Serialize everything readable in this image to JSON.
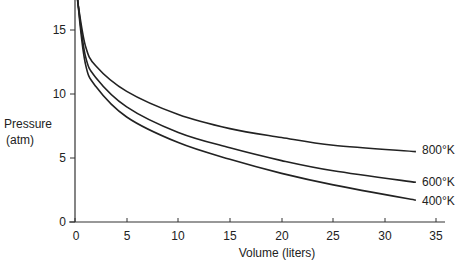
{
  "chart_data": {
    "type": "line",
    "title": "",
    "xlabel": "Volume (liters)",
    "ylabel": "Pressure (atm)",
    "ylabel_lines": [
      "Pressure",
      "(atm)"
    ],
    "xlim": [
      0,
      36
    ],
    "ylim": [
      0,
      17.3
    ],
    "xticks": [
      0,
      5,
      10,
      15,
      20,
      25,
      30,
      35
    ],
    "yticks": [
      0,
      5,
      10,
      15
    ],
    "grid": false,
    "legend": "inline labels at right end of curves",
    "x": [
      0.3,
      1,
      2,
      5,
      10,
      15,
      20,
      25,
      33
    ],
    "series": [
      {
        "name": "800°K",
        "values": [
          17.0,
          13.8,
          12.2,
          10.2,
          8.4,
          7.3,
          6.6,
          6.0,
          5.5
        ]
      },
      {
        "name": "600°K",
        "values": [
          17.0,
          13.0,
          11.3,
          9.0,
          7.0,
          5.8,
          4.8,
          4.0,
          3.1
        ]
      },
      {
        "name": "400°K",
        "values": [
          17.0,
          12.4,
          10.6,
          8.2,
          6.2,
          4.9,
          3.8,
          2.9,
          1.7
        ]
      }
    ]
  },
  "axes": {
    "x_ticks": [
      "0",
      "5",
      "10",
      "15",
      "20",
      "25",
      "30",
      "35"
    ],
    "y_ticks": [
      "0",
      "5",
      "10",
      "15"
    ],
    "x_title": "Volume (liters)",
    "y_title_line1": "Pressure",
    "y_title_line2": "(atm)"
  },
  "labels": {
    "s800": "800°K",
    "s600": "600°K",
    "s400": "400°K"
  },
  "colors": {
    "line": "#222222",
    "axis": "#333333"
  }
}
